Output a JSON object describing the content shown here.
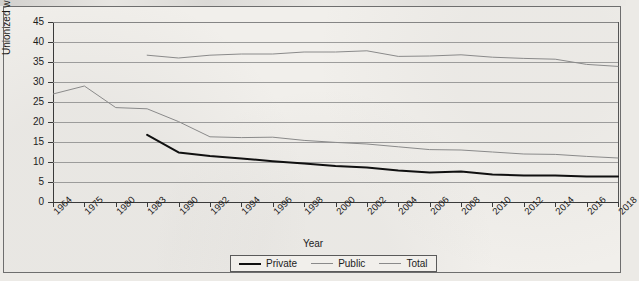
{
  "chart_data": {
    "type": "line",
    "title": "",
    "xlabel": "Year",
    "ylabel": "Unionized workers (%)",
    "ylim": [
      0,
      45
    ],
    "ytick_step": 5,
    "yticks": [
      45,
      40,
      35,
      30,
      25,
      20,
      15,
      10,
      5,
      0
    ],
    "grid": true,
    "legend_position": "bottom-center",
    "categories": [
      "1964",
      "1975",
      "1980",
      "1983",
      "1990",
      "1992",
      "1994",
      "1996",
      "1998",
      "2000",
      "2002",
      "2004",
      "2006",
      "2008",
      "2010",
      "2012",
      "2014",
      "2016",
      "2018"
    ],
    "series": [
      {
        "name": "Private",
        "color": "#101010",
        "width": "thick",
        "values": [
          null,
          null,
          null,
          16.8,
          12.4,
          11.5,
          10.9,
          10.2,
          9.6,
          9.0,
          8.6,
          7.9,
          7.4,
          7.6,
          6.9,
          6.6,
          6.6,
          6.4,
          6.4
        ]
      },
      {
        "name": "Public",
        "color": "#8a8a8a",
        "width": "thin",
        "values": [
          null,
          null,
          null,
          36.7,
          36.0,
          36.7,
          37.0,
          37.0,
          37.5,
          37.5,
          37.8,
          36.4,
          36.5,
          36.8,
          36.2,
          35.9,
          35.7,
          34.4,
          33.9
        ]
      },
      {
        "name": "Total",
        "color": "#8a8a8a",
        "width": "thin",
        "values": [
          27.0,
          29.0,
          23.6,
          23.3,
          20.1,
          16.3,
          16.1,
          16.2,
          15.4,
          14.9,
          14.5,
          13.8,
          13.1,
          13.0,
          12.5,
          12.0,
          11.9,
          11.4,
          11.0
        ]
      }
    ]
  },
  "legend": {
    "items": [
      {
        "label": "Private"
      },
      {
        "label": "Public"
      },
      {
        "label": "Total"
      }
    ]
  },
  "axes": {
    "y_label": "Unionized workers (%)",
    "x_label": "Year"
  }
}
